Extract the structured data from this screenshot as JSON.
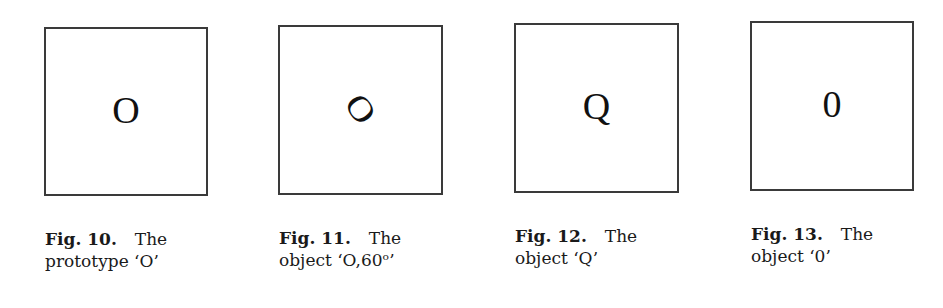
{
  "figures": [
    {
      "label": "Fig. 10.",
      "title_word": "The",
      "line2": "prototype ‘O’",
      "glyph": "O",
      "rotated": false
    },
    {
      "label": "Fig. 11.",
      "title_word": "The",
      "line2": "object ‘O,60ᵒ’",
      "glyph": "O",
      "rotated": true
    },
    {
      "label": "Fig. 12.",
      "title_word": "The",
      "line2": "object ‘Q’",
      "glyph": "Q",
      "rotated": false
    },
    {
      "label": "Fig. 13.",
      "title_word": "The",
      "line2": "object ‘0’",
      "glyph": "0",
      "rotated": false
    }
  ]
}
